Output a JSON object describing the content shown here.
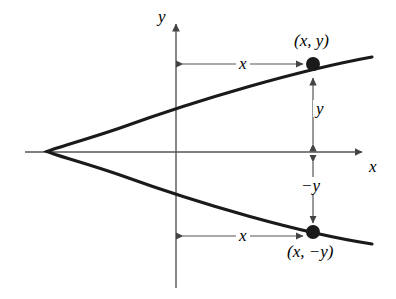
{
  "figure": {
    "type": "math-diagram",
    "background_color": "#ffffff",
    "curve_color": "#1a1a1a",
    "axis_color": "#555555",
    "measure_color": "#555555",
    "point_color": "#1a1a1a"
  },
  "axes": {
    "y_axis_label": "y",
    "x_axis_label": "x",
    "origin": {
      "x": 176,
      "y": 152
    },
    "x_axis": {
      "x_start": 25,
      "x_end": 368,
      "y": 152
    },
    "y_axis": {
      "x": 176,
      "y_start": 17,
      "y_end": 288
    }
  },
  "curve": {
    "name": "parabola",
    "opens": "right",
    "vertex": {
      "x": 47,
      "y": 151
    },
    "symmetry_axis": "x-axis",
    "upper_end": {
      "x": 372,
      "y": 57
    },
    "lower_end": {
      "x": 372,
      "y": 244
    }
  },
  "points": [
    {
      "id": "upper-point",
      "label": "(x, y)",
      "px": {
        "x": 313,
        "y": 64
      },
      "label_px": {
        "x": 295,
        "y": 32
      }
    },
    {
      "id": "lower-point",
      "label": "(x, −y)",
      "px": {
        "x": 313,
        "y": 232
      },
      "label_px": {
        "x": 288,
        "y": 243
      }
    }
  ],
  "measurements": [
    {
      "id": "upper-x-measure",
      "label": "x",
      "orientation": "horizontal",
      "from": {
        "x": 176,
        "y": 64
      },
      "to": {
        "x": 310,
        "y": 64
      },
      "label_px": {
        "x": 236,
        "y": 55
      }
    },
    {
      "id": "lower-x-measure",
      "label": "x",
      "orientation": "horizontal",
      "from": {
        "x": 176,
        "y": 236
      },
      "to": {
        "x": 310,
        "y": 236
      },
      "label_px": {
        "x": 236,
        "y": 227
      }
    },
    {
      "id": "y-measure",
      "label": "y",
      "orientation": "vertical",
      "from": {
        "x": 313,
        "y": 72
      },
      "to": {
        "x": 313,
        "y": 148
      },
      "label_px": {
        "x": 314,
        "y": 100
      }
    },
    {
      "id": "negative-y-measure",
      "label": "−y",
      "orientation": "vertical",
      "from": {
        "x": 313,
        "y": 157
      },
      "to": {
        "x": 313,
        "y": 227
      },
      "label_px": {
        "x": 299,
        "y": 177
      }
    }
  ]
}
